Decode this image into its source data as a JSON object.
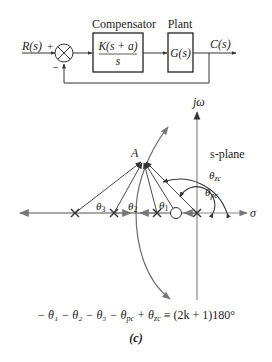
{
  "block_diagram": {
    "input_label": "R(s)",
    "plus_sign": "+",
    "minus_sign": "−",
    "compensator": {
      "title": "Compensator",
      "numerator": "K(s + a)",
      "denominator": "s"
    },
    "plant": {
      "title": "Plant",
      "transfer": "G(s)"
    },
    "output_label": "C(s)"
  },
  "root_locus": {
    "axis_imag_label": "jω",
    "axis_real_label": "σ",
    "plane_label": "s-plane",
    "point_label": "A",
    "angle_labels": {
      "theta1": "θ",
      "theta1_sub": "1",
      "theta2": "θ",
      "theta2_sub": "2",
      "theta3": "θ",
      "theta3_sub": "3",
      "theta_pc": "θ",
      "theta_pc_sub": "pc",
      "theta_zc": "θ",
      "theta_zc_sub": "zc"
    },
    "poles_x": [
      75,
      114,
      157,
      197
    ],
    "zero_x": 176,
    "colors": {
      "axis": "#8a8a8a",
      "line": "#3a3a3a",
      "text": "#222222"
    }
  },
  "equation": {
    "lhs": "− θ₁ − θ₂ − θ₃ − θ",
    "pc_sub": "pc",
    "mid": " + θ",
    "zc_sub": "zc",
    "rhs": " ≡ (2k + 1)180°"
  },
  "caption": "(c)"
}
